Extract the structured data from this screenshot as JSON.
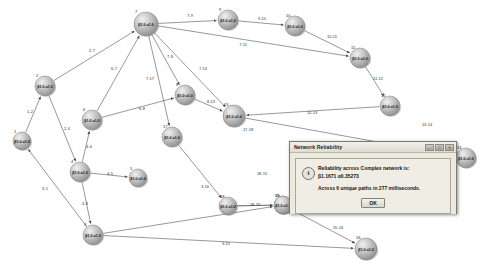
{
  "app": {
    "background": "#ffffff",
    "node_fill": "#b6b6b6",
    "edge_color": "#6b6b6b"
  },
  "graph": {
    "nodes": [
      {
        "id": "1",
        "label": "β1.0 α1.0",
        "x": 22,
        "y": 141,
        "r": 9
      },
      {
        "id": "2",
        "label": "β1.0 α1.0",
        "x": 45,
        "y": 86,
        "r": 10
      },
      {
        "id": "3",
        "label": "β1.0 α1.0",
        "x": 93,
        "y": 235,
        "r": 10
      },
      {
        "id": "4",
        "label": "β1.0 α1.0",
        "x": 80,
        "y": 172,
        "r": 10
      },
      {
        "id": "5",
        "label": "β1.0 α1.0",
        "x": 138,
        "y": 178,
        "r": 9
      },
      {
        "id": "6",
        "label": "β1.0 α1.0",
        "x": 92,
        "y": 120,
        "r": 10
      },
      {
        "id": "7",
        "label": "β1.0 α1.0",
        "x": 146,
        "y": 24,
        "r": 12
      },
      {
        "id": "8",
        "label": "β1.0 α1.0",
        "x": 185,
        "y": 95,
        "r": 10
      },
      {
        "id": "9",
        "label": "β1.0 α1.0",
        "x": 228,
        "y": 20,
        "r": 10
      },
      {
        "id": "10",
        "label": "β1.0 α1.0",
        "x": 295,
        "y": 26,
        "r": 10
      },
      {
        "id": "11",
        "label": "β1.0 α1.0",
        "x": 360,
        "y": 58,
        "r": 10
      },
      {
        "id": "12",
        "label": "β1.0 α1.0",
        "x": 390,
        "y": 106,
        "r": 10
      },
      {
        "id": "13",
        "label": "β1.0 α1.0",
        "x": 234,
        "y": 116,
        "r": 11
      },
      {
        "id": "14",
        "label": "β1.0 α1.0",
        "x": 466,
        "y": 158,
        "r": 10
      },
      {
        "id": "15",
        "label": "β1.0 α1.0",
        "x": 283,
        "y": 205,
        "r": 9
      },
      {
        "id": "16",
        "label": "β1.0 α1.0",
        "x": 366,
        "y": 249,
        "r": 11
      },
      {
        "id": "17",
        "label": "β1.0 α1.0",
        "x": 172,
        "y": 137,
        "r": 10
      },
      {
        "id": "18",
        "label": "β1.0 α1.0",
        "x": 228,
        "y": 206,
        "r": 9
      },
      {
        "id": "19",
        "label": "β1.0 α1.0",
        "x": 283,
        "y": 205,
        "r": 9
      }
    ],
    "edges": [
      {
        "from": "1",
        "to": "2",
        "label": "1-2",
        "lx": 30,
        "ly": 113
      },
      {
        "from": "2",
        "to": "4",
        "label": "2-4",
        "lx": 67,
        "ly": 130
      },
      {
        "from": "2",
        "to": "7",
        "label": "2-7",
        "lx": 92,
        "ly": 52
      },
      {
        "from": "3",
        "to": "1",
        "label": "3-1",
        "lx": 45,
        "ly": 190
      },
      {
        "from": "4",
        "to": "3",
        "label": "4-3",
        "lx": 85,
        "ly": 205
      },
      {
        "from": "4",
        "to": "5",
        "label": "4-5",
        "lx": 110,
        "ly": 175
      },
      {
        "from": "4",
        "to": "6",
        "label": "4-6",
        "lx": 89,
        "ly": 148
      },
      {
        "from": "6",
        "to": "7",
        "label": "6-7",
        "lx": 114,
        "ly": 70
      },
      {
        "from": "6",
        "to": "8",
        "label": "6-8",
        "lx": 142,
        "ly": 110
      },
      {
        "from": "7",
        "to": "9",
        "label": "7-9",
        "lx": 190,
        "ly": 17
      },
      {
        "from": "7",
        "to": "8",
        "label": "7-8",
        "lx": 170,
        "ly": 58
      },
      {
        "from": "7",
        "to": "13",
        "label": "7-13",
        "lx": 203,
        "ly": 70
      },
      {
        "from": "7",
        "to": "17",
        "label": "7-17",
        "lx": 150,
        "ly": 80
      },
      {
        "from": "7",
        "to": "11",
        "label": "7-11",
        "lx": 243,
        "ly": 46
      },
      {
        "from": "8",
        "to": "13",
        "label": "8-13",
        "lx": 211,
        "ly": 103
      },
      {
        "from": "9",
        "to": "10",
        "label": "9-10",
        "lx": 262,
        "ly": 20
      },
      {
        "from": "10",
        "to": "11",
        "label": "10-11",
        "lx": 332,
        "ly": 38
      },
      {
        "from": "11",
        "to": "12",
        "label": "11-12",
        "lx": 378,
        "ly": 80
      },
      {
        "from": "12",
        "to": "13",
        "label": "12-13",
        "lx": 312,
        "ly": 114
      },
      {
        "from": "13",
        "to": "14",
        "label": "13-14",
        "lx": 427,
        "ly": 126
      },
      {
        "from": "17",
        "to": "18",
        "label": "17-18",
        "lx": 248,
        "ly": 131
      },
      {
        "from": "3",
        "to": "16",
        "label": "3-16",
        "lx": 205,
        "ly": 188
      },
      {
        "from": "18",
        "to": "15",
        "label": "18-15",
        "lx": 262,
        "ly": 175
      },
      {
        "from": "18",
        "to": "19",
        "label": "18-19",
        "lx": 255,
        "ly": 206
      },
      {
        "from": "15",
        "to": "16",
        "label": "15-16",
        "lx": 338,
        "ly": 229
      },
      {
        "from": "3",
        "to": "15",
        "label": "3-15",
        "lx": 226,
        "ly": 245
      }
    ]
  },
  "dialog": {
    "title": "Network Reliability",
    "window_buttons": [
      "–",
      "□",
      "✕"
    ],
    "icon": "i",
    "message_line_1": "Reliability across Complex network is:",
    "message_line_2": "β1.1671 α0.35273",
    "message_line_3": "Across 6 unique paths in 277 milliseconds.",
    "ok_label": "OK"
  }
}
